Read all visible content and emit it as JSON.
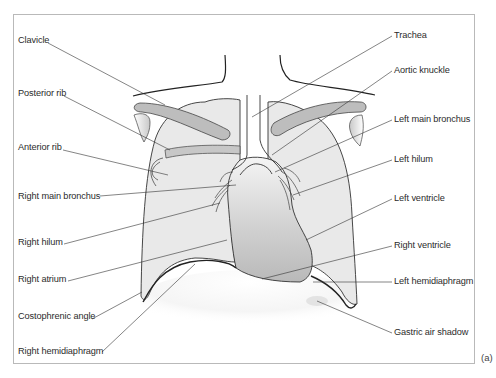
{
  "figure": {
    "panel_label": "(a)",
    "labels_left": [
      {
        "id": "clavicle",
        "text": "Clavicle"
      },
      {
        "id": "posterior-rib",
        "text": "Posterior rib"
      },
      {
        "id": "anterior-rib",
        "text": "Anterior rib"
      },
      {
        "id": "right-main-bronchus",
        "text": "Right main bronchus"
      },
      {
        "id": "right-hilum",
        "text": "Right hilum"
      },
      {
        "id": "right-atrium",
        "text": "Right atrium"
      },
      {
        "id": "costophrenic-angle",
        "text": "Costophrenic angle"
      },
      {
        "id": "right-hemidiaphragm",
        "text": "Right hemidiaphragm"
      }
    ],
    "labels_right": [
      {
        "id": "trachea",
        "text": "Trachea"
      },
      {
        "id": "aortic-knuckle",
        "text": "Aortic knuckle"
      },
      {
        "id": "left-main-bronchus",
        "text": "Left main bronchus"
      },
      {
        "id": "left-hilum",
        "text": "Left hilum"
      },
      {
        "id": "left-ventricle",
        "text": "Left ventricle"
      },
      {
        "id": "right-ventricle",
        "text": "Right ventricle"
      },
      {
        "id": "left-hemidiaphragm",
        "text": "Left hemidiaphragm"
      },
      {
        "id": "gastric-air-shadow",
        "text": "Gastric air shadow"
      }
    ]
  }
}
